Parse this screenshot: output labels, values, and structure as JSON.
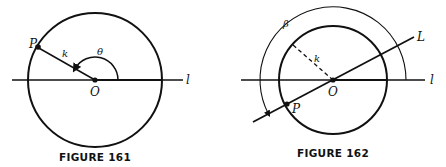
{
  "figures": [
    {
      "caption": "FIGURE 161",
      "labels": {
        "point": "P",
        "radius": "k",
        "angle": "θ",
        "origin": "O",
        "line": "l"
      },
      "geometry": {
        "center": [
          95,
          80
        ],
        "radius": 67,
        "point_angle_deg": 150
      }
    },
    {
      "caption": "FIGURE 162",
      "labels": {
        "point": "P",
        "radius": "k",
        "angle": "β",
        "origin": "O",
        "line": "l",
        "second_line": "L"
      },
      "geometry": {
        "center": [
          333,
          80
        ],
        "radius": 54,
        "line_L_angle_deg": 28,
        "angle_beta_deg": 208
      }
    }
  ]
}
